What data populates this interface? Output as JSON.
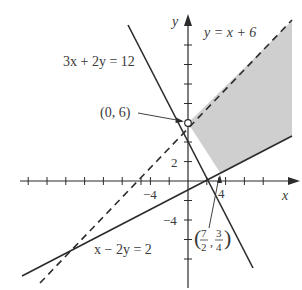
{
  "figure": {
    "type": "linear-inequality-graph",
    "axes": {
      "x_label": "x",
      "y_label": "y",
      "tick_step": 2,
      "x_tick_labels": [
        {
          "value": -4,
          "text": "−4"
        },
        {
          "value": 4,
          "text": "4"
        }
      ],
      "y_tick_labels": [
        {
          "value": 2,
          "text": "2"
        },
        {
          "value": -4,
          "text": "−4"
        }
      ],
      "x_range": [
        -18,
        11
      ],
      "y_range": [
        -11,
        17
      ]
    },
    "lines": [
      {
        "id": "dashed",
        "equation": "y = x + 6",
        "style": "dashed"
      },
      {
        "id": "steep",
        "equation": "3x + 2y = 12",
        "style": "solid"
      },
      {
        "id": "shallow",
        "equation": "x − 2y = 2",
        "style": "solid"
      }
    ],
    "points": [
      {
        "label": "(0, 6)",
        "x": 0,
        "y": 6,
        "marker": "open-circle"
      },
      {
        "label_prefix": "(",
        "num1": "7",
        "den1": "2",
        "sep": ",",
        "num2": "3",
        "den2": "4",
        "label_suffix": ")",
        "x": 3.5,
        "y": 0.75,
        "marker": "none"
      }
    ],
    "shaded_region": {
      "description": "feasible region bounded by y = x + 6 (dashed), 3x + 2y = 12 and x − 2y = 2",
      "vertices": [
        [
          0,
          6
        ],
        [
          3.5,
          0.75
        ]
      ],
      "fill": "#c8c8c8"
    },
    "colors": {
      "line": "#2b2b2b",
      "text": "#3a3a3a",
      "shade": "#cfcfcf"
    }
  }
}
